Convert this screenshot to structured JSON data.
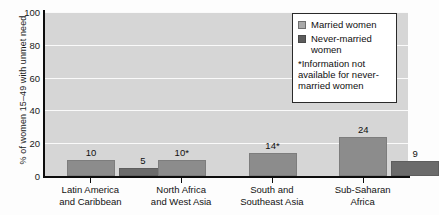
{
  "chart_data": {
    "type": "bar",
    "title": "",
    "xlabel": "",
    "ylabel": "% of women 15–49 with unmet need",
    "ylim": [
      0,
      100
    ],
    "ytick_labels": [
      "0",
      "20",
      "40",
      "60",
      "80",
      "100"
    ],
    "ytick_values": [
      0,
      20,
      40,
      60,
      80,
      100
    ],
    "grid": "horizontal",
    "legend_position": "top-right",
    "categories": [
      "Latin America and Caribbean",
      "North Africa and West Asia",
      "South and Southeast Asia",
      "Sub-Saharan Africa"
    ],
    "category_lines": [
      [
        "Latin America",
        "and Caribbean"
      ],
      [
        "North Africa",
        "and West Asia"
      ],
      [
        "South and",
        "Southeast Asia"
      ],
      [
        "Sub-Saharan",
        "Africa"
      ]
    ],
    "series": [
      {
        "name": "Married women",
        "color": "#8c8c8c",
        "values": [
          10,
          10,
          14,
          24
        ],
        "labels": [
          "10",
          "10*",
          "14*",
          "24"
        ]
      },
      {
        "name": "Never-married women",
        "color": "#6b6b6b",
        "values": [
          5,
          null,
          null,
          9
        ],
        "labels": [
          "5",
          "",
          "",
          "9"
        ]
      }
    ]
  },
  "legend": {
    "items": [
      {
        "label": "Married women",
        "swatch": "married"
      },
      {
        "label": "Never-married women",
        "swatch": "never"
      }
    ],
    "item_lines": [
      [
        "Married women"
      ],
      [
        "Never-married",
        "women"
      ]
    ],
    "note_lines": [
      "*Information not",
      "available for never-",
      "married women"
    ]
  },
  "colors": {
    "plot_background": "#d6d6d6",
    "gridline": "#fafafa",
    "axis": "#0c0c0c",
    "married_bar": "#8c8c8c",
    "never_married_bar": "#6b6b6b",
    "legend_background": "#ffffff",
    "legend_border": "#2a2a2a"
  }
}
